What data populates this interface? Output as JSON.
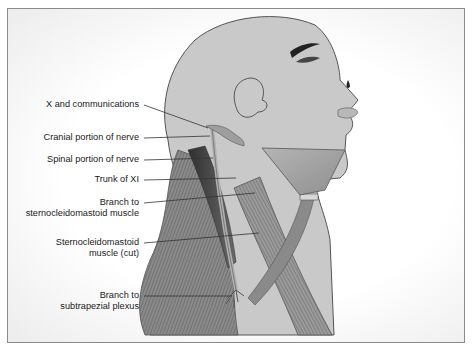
{
  "figure": {
    "colors": {
      "skin": "#c9c9c9",
      "outline": "#555555",
      "muscle_dark": "#4a4a4a",
      "muscle_mid": "#7b7b7b",
      "nerve": "#b8b8b8",
      "leader_line": "#333333",
      "frame_border": "#8a8a8a"
    },
    "labels": [
      {
        "id": "x-and-communications",
        "line1": "X and communications",
        "line2": ""
      },
      {
        "id": "cranial-portion",
        "line1": "Cranial portion of nerve",
        "line2": ""
      },
      {
        "id": "spinal-portion",
        "line1": "Spinal portion of nerve",
        "line2": ""
      },
      {
        "id": "trunk-of-xi",
        "line1": "Trunk of XI",
        "line2": ""
      },
      {
        "id": "branch-to-scm",
        "line1": "Branch to",
        "line2": "sternocleidomastoid muscle"
      },
      {
        "id": "scm-cut",
        "line1": "Sternocleidomastoid",
        "line2": "muscle (cut)"
      },
      {
        "id": "branch-to-subtrapezial",
        "line1": "Branch to",
        "line2": "subtrapezial plexus"
      }
    ]
  }
}
